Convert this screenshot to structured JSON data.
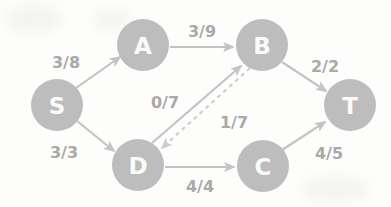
{
  "diagram": {
    "label_format": "flow/capacity",
    "colors": {
      "node_fill": "#bdbdbd",
      "node_text": "#fbfbfb",
      "edge": "#c3c3c3",
      "edge_dashed": "#cdcdcd",
      "label_text": "#a9a9a9",
      "background": "#fdfdfc"
    },
    "nodes": [
      {
        "id": "S",
        "label": "S",
        "x": 57,
        "y": 105,
        "r": 26
      },
      {
        "id": "A",
        "label": "A",
        "x": 143,
        "y": 45,
        "r": 26
      },
      {
        "id": "B",
        "label": "B",
        "x": 262,
        "y": 45,
        "r": 26
      },
      {
        "id": "T",
        "label": "T",
        "x": 350,
        "y": 105,
        "r": 26
      },
      {
        "id": "D",
        "label": "D",
        "x": 138,
        "y": 165,
        "r": 26
      },
      {
        "id": "C",
        "label": "C",
        "x": 263,
        "y": 166,
        "r": 26
      }
    ],
    "edges": [
      {
        "id": "S-A",
        "from": "S",
        "to": "A",
        "label": "3/8",
        "flow": 3,
        "capacity": 8,
        "style": "solid",
        "label_x": 66,
        "label_y": 62
      },
      {
        "id": "S-D",
        "from": "S",
        "to": "D",
        "label": "3/3",
        "flow": 3,
        "capacity": 3,
        "style": "solid",
        "label_x": 64,
        "label_y": 152
      },
      {
        "id": "A-B",
        "from": "A",
        "to": "B",
        "label": "3/9",
        "flow": 3,
        "capacity": 9,
        "style": "solid",
        "label_x": 202,
        "label_y": 31
      },
      {
        "id": "B-T",
        "from": "B",
        "to": "T",
        "label": "2/2",
        "flow": 2,
        "capacity": 2,
        "style": "solid",
        "label_x": 325,
        "label_y": 66
      },
      {
        "id": "D-B",
        "from": "D",
        "to": "B",
        "label": "0/7",
        "flow": 0,
        "capacity": 7,
        "style": "solid",
        "label_x": 165,
        "label_y": 102
      },
      {
        "id": "B-D",
        "from": "B",
        "to": "D",
        "label": "1/7",
        "flow": 1,
        "capacity": 7,
        "style": "dashed",
        "label_x": 234,
        "label_y": 122
      },
      {
        "id": "D-C",
        "from": "D",
        "to": "C",
        "label": "4/4",
        "flow": 4,
        "capacity": 4,
        "style": "solid",
        "label_x": 200,
        "label_y": 186
      },
      {
        "id": "C-T",
        "from": "C",
        "to": "T",
        "label": "4/5",
        "flow": 4,
        "capacity": 5,
        "style": "solid",
        "label_x": 329,
        "label_y": 153
      }
    ]
  }
}
